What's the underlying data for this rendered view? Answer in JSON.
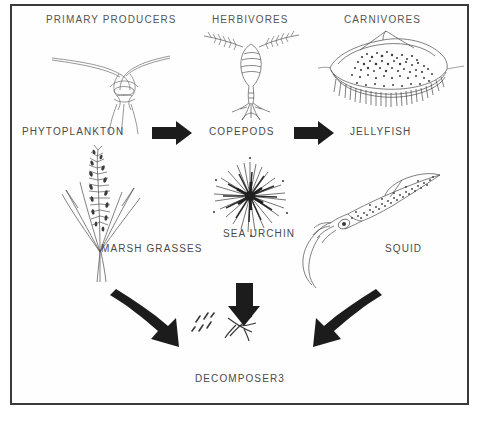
{
  "diagram": {
    "type": "marine-food-web",
    "frame_color": "#3a3a3a",
    "text_color": "#4a4a4a",
    "background": "#ffffff",
    "columns": [
      {
        "id": "primary-producers",
        "heading": "PRIMARY PRODUCERS"
      },
      {
        "id": "herbivores",
        "heading": "HERBIVORES"
      },
      {
        "id": "carnivores",
        "heading": "CARNIVORES"
      }
    ],
    "organisms": [
      {
        "id": "phytoplankton",
        "label": "PHYTOPLANKTON",
        "trophic": "primary-producers",
        "row": "top"
      },
      {
        "id": "copepods",
        "label": "COPEPODS",
        "trophic": "herbivores",
        "row": "top"
      },
      {
        "id": "jellyfish",
        "label": "JELLYFISH",
        "trophic": "carnivores",
        "row": "top"
      },
      {
        "id": "marsh-grasses",
        "label": "MARSH GRASSES",
        "trophic": "primary-producers",
        "row": "bottom"
      },
      {
        "id": "sea-urchin",
        "label": "SEA URCHIN",
        "trophic": "herbivores",
        "row": "bottom"
      },
      {
        "id": "squid",
        "label": "SQUID",
        "trophic": "carnivores",
        "row": "bottom"
      }
    ],
    "decomposers": {
      "label": "DECOMPOSER3"
    },
    "flows": [
      {
        "id": "producers-to-herbivores",
        "from": "phytoplankton",
        "to": "copepods",
        "style": "straight-right"
      },
      {
        "id": "herbivores-to-carnivores",
        "from": "copepods",
        "to": "jellyfish",
        "style": "straight-right"
      },
      {
        "id": "producers-to-decomposers",
        "from": "marsh-grasses",
        "to": "decomposers",
        "style": "curved-down-right"
      },
      {
        "id": "herbivores-to-decomposers",
        "from": "sea-urchin",
        "to": "decomposers",
        "style": "straight-down"
      },
      {
        "id": "carnivores-to-decomposers",
        "from": "squid",
        "to": "decomposers",
        "style": "curved-down-left"
      }
    ]
  }
}
